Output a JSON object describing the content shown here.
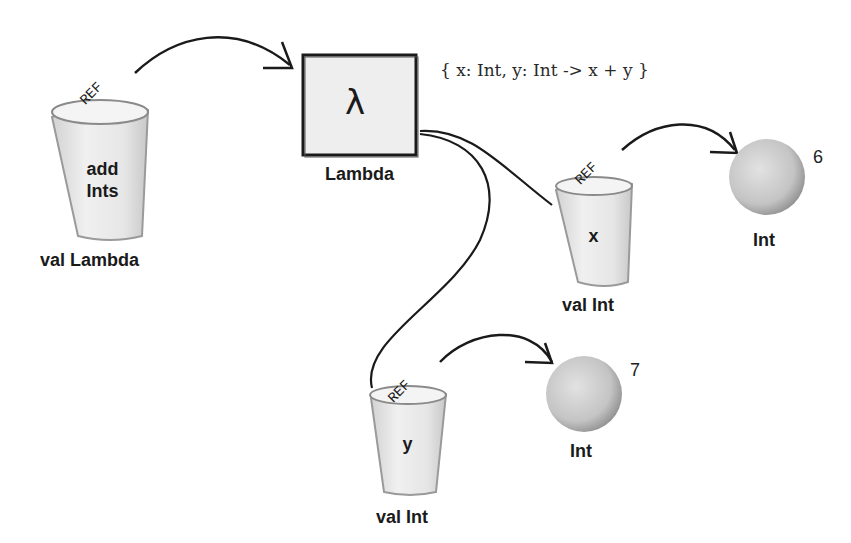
{
  "diagram": {
    "lambda_expression": "{ x: Int, y: Int -> x + y }",
    "lambda_object": {
      "symbol": "λ",
      "label": "Lambda"
    },
    "variables": [
      {
        "name_lines": [
          "add",
          "Ints"
        ],
        "type_label": "val Lambda",
        "ref_label": "REF"
      },
      {
        "name_lines": [
          "x"
        ],
        "type_label": "val Int",
        "ref_label": "REF"
      },
      {
        "name_lines": [
          "y"
        ],
        "type_label": "val Int",
        "ref_label": "REF"
      }
    ],
    "values": [
      {
        "label": "Int",
        "value": "6"
      },
      {
        "label": "Int",
        "value": "7"
      }
    ]
  }
}
